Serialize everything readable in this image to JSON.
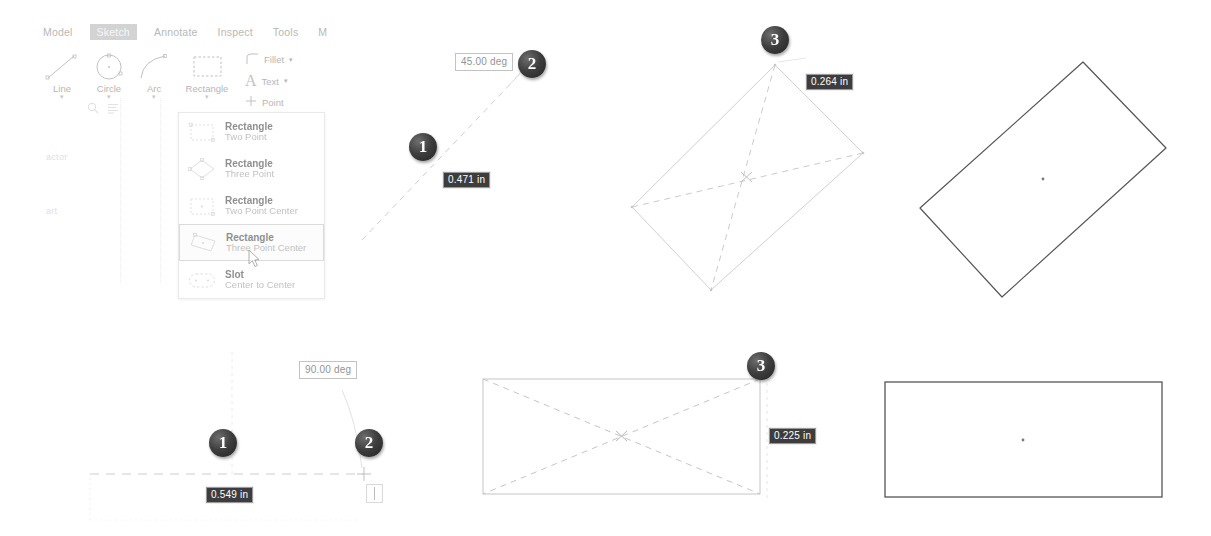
{
  "app": {
    "tabs": [
      {
        "label": "Model",
        "active": false
      },
      {
        "label": "Sketch",
        "active": true
      },
      {
        "label": "Annotate",
        "active": false
      },
      {
        "label": "Inspect",
        "active": false
      },
      {
        "label": "Tools",
        "active": false
      },
      {
        "label": "M",
        "active": false
      }
    ],
    "ribbon": {
      "items": [
        {
          "label": "Line",
          "icon": "line-icon",
          "caret": "▾"
        },
        {
          "label": "Circle",
          "icon": "circle-icon",
          "caret": "▾"
        },
        {
          "label": "Arc",
          "icon": "arc-icon",
          "caret": "▾"
        },
        {
          "label": "Rectangle",
          "icon": "rectangle-icon",
          "caret": "▾"
        }
      ],
      "small_items": [
        {
          "label": "Fillet",
          "icon": "fillet-icon",
          "caret": "▾"
        },
        {
          "label": "Text",
          "icon": "text-icon",
          "caret": "▾"
        },
        {
          "label": "Point",
          "icon": "point-icon",
          "caret": ""
        }
      ]
    },
    "sidebar": {
      "search_icon": "search-icon",
      "filter_icon": "list-filter-icon",
      "entries": [
        "actor",
        "art"
      ]
    },
    "menu": {
      "items": [
        {
          "title": "Rectangle",
          "subtitle": "Two Point",
          "icon": "rectangle-two-point-icon",
          "selected": false
        },
        {
          "title": "Rectangle",
          "subtitle": "Three Point",
          "icon": "rectangle-three-point-icon",
          "selected": false
        },
        {
          "title": "Rectangle",
          "subtitle": "Two Point Center",
          "icon": "rectangle-two-point-center-icon",
          "selected": false
        },
        {
          "title": "Rectangle",
          "subtitle": "Three Point Center",
          "icon": "rectangle-three-point-center-icon",
          "selected": true
        },
        {
          "title": "Slot",
          "subtitle": "Center to Center",
          "icon": "slot-center-to-center-icon",
          "selected": false
        }
      ]
    }
  },
  "steps": {
    "top": {
      "badge1": "1",
      "badge2": "2",
      "badge3": "3",
      "angle_value": "45.00 deg",
      "length_value": "0.471 in",
      "width_value": "0.264 in"
    },
    "bottom": {
      "badge1": "1",
      "badge2": "2",
      "badge3": "3",
      "angle_value": "90.00 deg",
      "length_value": "0.549 in",
      "width_value": "0.225 in"
    }
  },
  "colors": {
    "badge_fill": "#3d3d3d",
    "value_box_fill": "#3d3d3d",
    "value_box_text": "#ffffff",
    "sketch_line": "#9a9a9a",
    "result_line": "#555555",
    "tab_active_fill": "#b9b9b9"
  },
  "geometry": {
    "top_result_rect_angle_deg": -28,
    "bottom_result_rect_angle_deg": 0
  }
}
